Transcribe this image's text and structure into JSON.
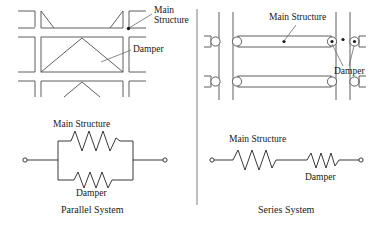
{
  "figure": {
    "type": "engineering-diagram",
    "divider_color": "#808080",
    "line_color": "#4d4d4d",
    "text_color": "#181818"
  },
  "panels": [
    {
      "id": "parallel",
      "caption": "Parallel  System",
      "frame": {
        "name": "parallel-frame",
        "annotations": [
          {
            "id": "main-structure",
            "text_line1": "Main",
            "text_line2": "Structure"
          },
          {
            "id": "damper",
            "text": "Damper"
          }
        ],
        "brace_type": "chevron-and-truss"
      },
      "schematic": {
        "name": "parallel-schematic",
        "top_label": "Main Structure",
        "bottom_label": "Damper",
        "arrangement": "parallel",
        "elements": [
          {
            "id": "main-structure-spring",
            "type": "spring",
            "coils": 4,
            "position": "top-branch"
          },
          {
            "id": "damper-spring",
            "type": "spring",
            "coils": 3,
            "position": "bottom-branch"
          }
        ],
        "terminals": 2
      }
    },
    {
      "id": "series",
      "caption": "Series  System",
      "frame": {
        "name": "series-frame",
        "annotations": [
          {
            "id": "main-structure",
            "text": "Main Structure"
          },
          {
            "id": "damper",
            "text": "Damper"
          }
        ],
        "beams": 2,
        "columns": 4,
        "hinges_per_beam": 2
      },
      "schematic": {
        "name": "series-schematic",
        "top_label": "Main Structure",
        "bottom_label": "Damper",
        "arrangement": "series",
        "elements": [
          {
            "id": "main-structure-spring",
            "type": "spring",
            "coils": 4,
            "position": "left"
          },
          {
            "id": "damper-spring",
            "type": "spring",
            "coils": 3,
            "position": "right"
          }
        ],
        "terminals": 2
      }
    }
  ]
}
